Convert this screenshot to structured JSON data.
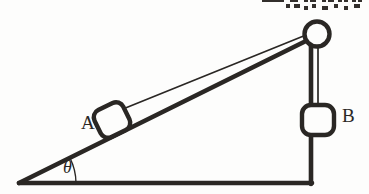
{
  "figure": {
    "background_color": "#fdfdfc",
    "ink_color": "#2a2724",
    "labels": {
      "block_a": "A",
      "block_b": "B",
      "angle": "θ"
    },
    "geometry": {
      "incline_apex": [
        19,
        183
      ],
      "incline_top": [
        311,
        38
      ],
      "base_right": [
        311,
        183
      ],
      "pulley_center": [
        317,
        34
      ],
      "pulley_radius": 13,
      "block_a_center": [
        112,
        120
      ],
      "block_b_center": [
        318,
        120
      ],
      "angle_degrees": 26
    },
    "elements": [
      "incline-surface",
      "incline-base",
      "incline-vertical-side",
      "pulley-wheel",
      "string-incline-segment",
      "string-vertical-segment",
      "block-a",
      "block-b",
      "angle-arc",
      "qr-watermark"
    ]
  }
}
